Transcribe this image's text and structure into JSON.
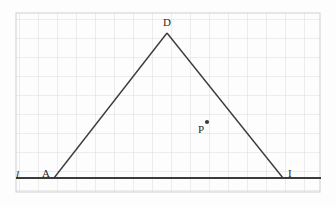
{
  "figure": {
    "background_color": "#fdfdfd",
    "grid": {
      "visible": true,
      "color": "#d8d8d8",
      "border_color": "#cccccc",
      "cell_size": 19,
      "left": 16,
      "top": 13,
      "right": 320,
      "bottom": 192,
      "columns": 16,
      "rows": 9
    },
    "stroke_color": "#3b3b3b",
    "line_l": {
      "label": "l",
      "label_x": 16,
      "label_y": 170,
      "x1": 16,
      "y1": 178,
      "x2": 321,
      "y2": 178,
      "width": 1.8
    },
    "triangle": {
      "stroke_width": 1.5,
      "vertices": [
        {
          "name": "A",
          "x": 54,
          "y": 178,
          "label": "A",
          "label_x": 42,
          "label_y": 169
        },
        {
          "name": "D",
          "x": 167,
          "y": 33,
          "label": "D",
          "label_x": 163,
          "label_y": 18
        },
        {
          "name": "I",
          "x": 283,
          "y": 178,
          "label": "I",
          "label_x": 288,
          "label_y": 169
        }
      ]
    },
    "point_p": {
      "label": "P",
      "x": 207,
      "y": 122,
      "radius": 2,
      "label_x": 198,
      "label_y": 126,
      "color": "#3b3b3b"
    }
  }
}
